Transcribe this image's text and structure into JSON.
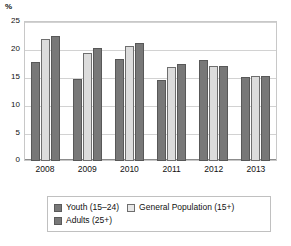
{
  "chart_data": {
    "type": "bar",
    "title": "",
    "subtitle": "",
    "unit_label": "%",
    "xlabel": "",
    "ylabel": "%",
    "ylim": [
      0,
      25
    ],
    "ytick_step": 5,
    "grid": true,
    "legend_position": "bottom",
    "categories": [
      "2008",
      "2009",
      "2010",
      "2011",
      "2012",
      "2013"
    ],
    "yticks": [
      "25",
      "20",
      "15",
      "10",
      "5",
      "0"
    ],
    "series": [
      {
        "name": "Youth (15–24)",
        "color": "#787878",
        "values": [
          17.7,
          14.6,
          18.3,
          14.5,
          18.1,
          15.0
        ]
      },
      {
        "name": "General Population (15+)",
        "color": "#dcdcdc",
        "values": [
          21.7,
          19.2,
          20.6,
          16.8,
          17.0,
          15.1
        ]
      },
      {
        "name": "Adults (25+)",
        "color": "#787878",
        "values": [
          22.4,
          20.2,
          21.0,
          17.3,
          16.9,
          15.1
        ]
      }
    ]
  },
  "legend": {
    "rows": [
      [
        "Youth (15–24)",
        "General Population (15+)"
      ],
      [
        "Adults (25+)"
      ]
    ]
  }
}
